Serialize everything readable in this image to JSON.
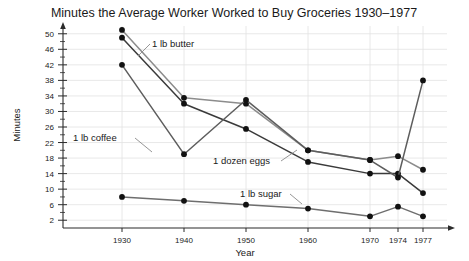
{
  "chart_data": {
    "type": "line",
    "title": "Minutes the Average Worker Worked to Buy Groceries 1930–1977",
    "xlabel": "Year",
    "ylabel": "Minutes",
    "categories": [
      "1930",
      "1940",
      "1950",
      "1960",
      "1970",
      "1974",
      "1977"
    ],
    "x": [
      1930,
      1940,
      1950,
      1960,
      1970,
      1974,
      1977
    ],
    "xlim": [
      1925,
      1980
    ],
    "ylim": [
      0,
      52
    ],
    "yticks": [
      2,
      6,
      10,
      14,
      18,
      22,
      26,
      30,
      34,
      38,
      42,
      46,
      50
    ],
    "ytick_labels": [
      "2",
      "6",
      "10",
      "14",
      "18",
      "22",
      "26",
      "30",
      "34",
      "38",
      "42",
      "46",
      "50"
    ],
    "xtick_labels": [
      "1930",
      "1940",
      "1950",
      "1960",
      "1970",
      "1974",
      "1977"
    ],
    "grid": true,
    "grid_axis": "both",
    "legend": "inline-annotations",
    "series": [
      {
        "name": "1 lb butter",
        "color": "#8c8c8c",
        "values": [
          51,
          33.5,
          32,
          20,
          17.5,
          18.5,
          15
        ]
      },
      {
        "name": "1 dozen eggs",
        "color": "#3a3a3a",
        "values": [
          49,
          32,
          25.5,
          17,
          14,
          14,
          9
        ]
      },
      {
        "name": "1 lb coffee",
        "color": "#5d5d5d",
        "values": [
          42,
          19,
          33,
          20,
          17.5,
          13,
          38
        ]
      },
      {
        "name": "1 lb sugar",
        "color": "#6e6e6e",
        "values": [
          8,
          7,
          6,
          5,
          3,
          5.5,
          3
        ]
      }
    ],
    "annotations": [
      {
        "label": "1 lb butter",
        "x": 152,
        "y": 47
      },
      {
        "label": "1 lb coffee",
        "x": 73,
        "y": 141
      },
      {
        "label": "1 dozen eggs",
        "x": 213,
        "y": 164
      },
      {
        "label": "1 lb sugar",
        "x": 240,
        "y": 197
      }
    ]
  }
}
